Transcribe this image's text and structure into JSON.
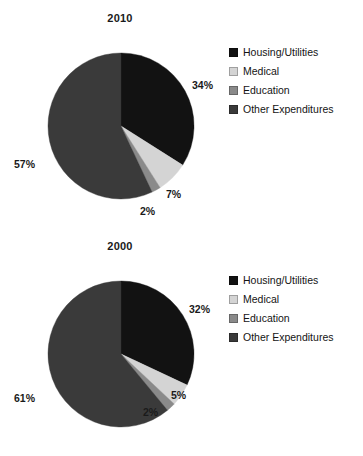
{
  "chart_data": [
    {
      "type": "pie",
      "title": "2010",
      "categories": [
        "Housing/Utilities",
        "Medical",
        "Education",
        "Other Expenditures"
      ],
      "values": [
        34,
        7,
        2,
        57
      ],
      "value_labels": [
        "34%",
        "7%",
        "2%",
        "57%"
      ],
      "colors": [
        "#121212",
        "#d4d4d4",
        "#8a8a8a",
        "#3a3a3a"
      ],
      "units": "percent",
      "start_angle_deg": 0,
      "direction": "clockwise",
      "legend_position": "right",
      "grid": false,
      "xlabel": "",
      "ylabel": ""
    },
    {
      "type": "pie",
      "title": "2000",
      "categories": [
        "Housing/Utilities",
        "Medical",
        "Education",
        "Other Expenditures"
      ],
      "values": [
        32,
        5,
        2,
        61
      ],
      "value_labels": [
        "32%",
        "5%",
        "2%",
        "61%"
      ],
      "colors": [
        "#121212",
        "#d4d4d4",
        "#8a8a8a",
        "#3a3a3a"
      ],
      "units": "percent",
      "start_angle_deg": 0,
      "direction": "clockwise",
      "legend_position": "right",
      "grid": false,
      "xlabel": "",
      "ylabel": ""
    }
  ],
  "charts": [
    {
      "title": "2010",
      "labels": {
        "housing": "34%",
        "medical": "7%",
        "education": "2%",
        "other": "57%"
      },
      "legend": [
        {
          "label": "Housing/Utilities",
          "color": "#121212"
        },
        {
          "label": "Medical",
          "color": "#d4d4d4"
        },
        {
          "label": "Education",
          "color": "#8a8a8a"
        },
        {
          "label": "Other Expenditures",
          "color": "#3a3a3a"
        }
      ]
    },
    {
      "title": "2000",
      "labels": {
        "housing": "32%",
        "medical": "5%",
        "education": "2%",
        "other": "61%"
      },
      "legend": [
        {
          "label": "Housing/Utilities",
          "color": "#121212"
        },
        {
          "label": "Medical",
          "color": "#d4d4d4"
        },
        {
          "label": "Education",
          "color": "#8a8a8a"
        },
        {
          "label": "Other Expenditures",
          "color": "#3a3a3a"
        }
      ]
    }
  ]
}
